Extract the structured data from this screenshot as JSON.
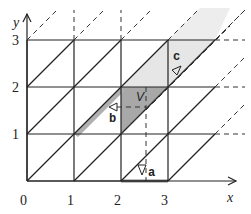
{
  "diagram": {
    "type": "triangular lattice on unit square grid with shaded parallelogram cell",
    "axes": {
      "x_label": "x",
      "y_label": "y",
      "x_ticks": [
        "0",
        "1",
        "2",
        "3"
      ],
      "y_ticks": [
        "1",
        "2",
        "3"
      ]
    },
    "labels": {
      "a": "a",
      "b": "b",
      "c": "c",
      "v": "V"
    },
    "colors": {
      "line": "#222222",
      "shade_dark": "#a8a8a8",
      "shade_light": "#e6e6e6",
      "background": "#ffffff"
    }
  }
}
